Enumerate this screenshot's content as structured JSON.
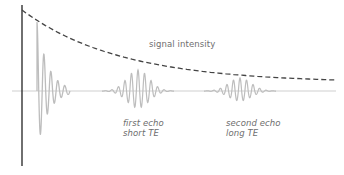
{
  "labels": {
    "signal_intensity": "signal intensity",
    "first_echo": {
      "line1": "first echo",
      "line2": "short TE"
    },
    "second_echo": {
      "line1": "second echo",
      "line2": "long TE"
    }
  },
  "colors": {
    "axis": "#222222",
    "envelope": "#444444",
    "waveform": "#bdbdbd",
    "baseline": "#cfcfcf",
    "text": "#6e6e6e"
  },
  "geometry": {
    "axis": {
      "x": 22,
      "y_top": 5,
      "y_bottom": 166
    },
    "baseline": {
      "y": 91,
      "x_start": 12,
      "x_end": 336
    },
    "envelope": {
      "x_start": 22,
      "y_start": 10,
      "x_end": 336,
      "y_end": 80
    },
    "fid": {
      "x_start": 37,
      "x_end": 70,
      "peak_y": 22,
      "trough_y": 150
    },
    "first_echo": {
      "center_x": 138,
      "half_width": 36,
      "peak_y": 70,
      "trough_y": 108
    },
    "second_echo": {
      "center_x": 240,
      "half_width": 36,
      "peak_y": 78,
      "trough_y": 101
    }
  }
}
